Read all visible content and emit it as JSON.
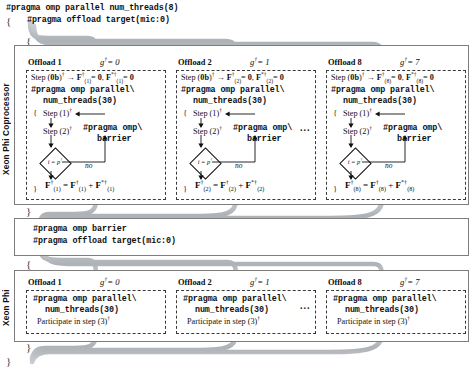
{
  "figure": {
    "top_code": {
      "line1": "#pragma omp parallel num_threads(8)",
      "line2": "#pragma offload target(mic:0)"
    },
    "braces": {
      "open": "{",
      "close": "}"
    },
    "side_labels": {
      "coprocessor": "Xeon Phi Coprocessor",
      "xeon_phi": "Xeon Phi"
    },
    "barrier_code": {
      "line1": "#pragma omp barrier",
      "line2": "#pragma offload target(mic:0)"
    },
    "ellipsis": "...",
    "shared": {
      "pragma_parallel": "#pragma omp parallel\\",
      "num_threads": "num_threads(30)",
      "pragma_barrier_1": "#pragma omp\\",
      "pragma_barrier_2": "barrier",
      "no_label": "no",
      "g_symbol": "g",
      "dagger": "†",
      "participate_prefix": "Participate in step (3)"
    },
    "top_offloads": [
      {
        "title": "Offload 1",
        "g_label": "g†= 0",
        "g_value": "0",
        "index": "(1)",
        "step0": "Step (0b)† → F†(1)= 0, F*†(1)= 0",
        "step1": "Step (1)†",
        "step2": "Step (2)†",
        "condition": "i = p†",
        "final_eq": "F†(1) = F†(1) + F*†(1)"
      },
      {
        "title": "Offload 2",
        "g_label": "g†= 1",
        "g_value": "1",
        "index": "(2)",
        "step0": "Step (0b)† → F†(2)= 0, F*†(2)= 0",
        "step1": "Step (1)†",
        "step2": "Step (2)†",
        "condition": "i = p†",
        "final_eq": "F†(2) = F†(2) + F*†(2)"
      },
      {
        "title": "Offload 8",
        "g_label": "g†= 7",
        "g_value": "7",
        "index": "(8)",
        "step0": "Step (0b)† → F†(8)= 0, F*†(8)= 0",
        "step1": "Step (1)†",
        "step2": "Step (2)†",
        "condition": "i = p†",
        "final_eq": "F†(8) = F†(8) + F*†(8)"
      }
    ],
    "bottom_offloads": [
      {
        "title": "Offload 1",
        "g_label": "g†= 0",
        "g_value": "0",
        "participate": "Participate in step (3)†"
      },
      {
        "title": "Offload 2",
        "g_label": "g†= 1",
        "g_value": "1",
        "participate": "Participate in step (3)†"
      },
      {
        "title": "Offload 8",
        "g_label": "g†= 7",
        "g_value": "7",
        "participate": "Participate in step (3)†"
      }
    ],
    "colors": {
      "ribbon": "#b5b9bd",
      "ribbon_edge": "#9aa0a5",
      "panel_border": "#7d7d7d",
      "card_border": "#3a3a3a",
      "text": "#111111"
    }
  }
}
